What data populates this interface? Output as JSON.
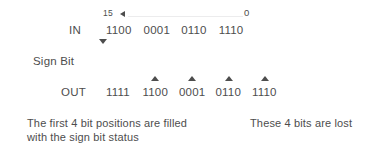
{
  "diagram": {
    "text_color": "#4d4d4d",
    "background_color": "#ffffff",
    "ruler": {
      "left_index": "15",
      "right_index": "0",
      "left_arrow_icon": "triangle-left-icon",
      "line_color": "#ececed"
    },
    "in_row": {
      "label": "IN",
      "groups": [
        "1100",
        "0001",
        "0110",
        "1110"
      ],
      "sign_bit_arrow_icon": "triangle-down-icon"
    },
    "sign_bit": {
      "label": "Sign Bit"
    },
    "out_row": {
      "label": "OUT",
      "groups": [
        "1111",
        "1100",
        "0001",
        "0110",
        "1110"
      ],
      "marker_icon": "triangle-up-icon",
      "marker_count": 4
    },
    "captions": {
      "left_line1": "The first 4 bit positions are filled",
      "left_line2": "with the sign bit status",
      "right": "These 4 bits are lost"
    }
  }
}
